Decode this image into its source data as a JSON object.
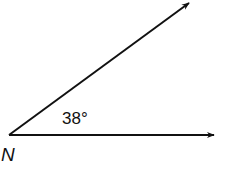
{
  "diagram": {
    "type": "angle",
    "vertex_label": "N",
    "angle_label": "38°",
    "angle_degrees": 38,
    "rays": [
      {
        "name": "horizontal-ray",
        "direction": "right"
      },
      {
        "name": "upper-ray",
        "direction": "up-right"
      }
    ],
    "colors": {
      "stroke": "#111111",
      "background": "#ffffff"
    }
  }
}
